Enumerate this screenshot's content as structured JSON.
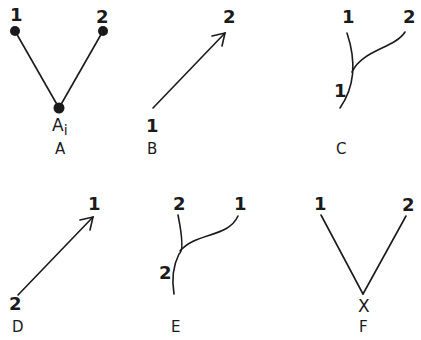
{
  "panels": {
    "A": {
      "caption": "A",
      "nodes": {
        "left_label": "1",
        "right_label": "2",
        "bottom_label": "A",
        "bottom_subscript": "i"
      },
      "description": "Two filled nodes 1 and 2 joined by lines to a filled node Ai below"
    },
    "B": {
      "caption": "B",
      "start_label": "1",
      "end_label": "2",
      "description": "Arrow from 1 (bottom-left) to 2 (top-right)"
    },
    "C": {
      "caption": "C",
      "top_left_label": "1",
      "top_right_label": "2",
      "lower_label": "1",
      "description": "Curve 1 continues downward; branch 2 merges into it"
    },
    "D": {
      "caption": "D",
      "start_label": "2",
      "end_label": "1",
      "description": "Arrow from 2 (bottom-left) to 1 (top-right)"
    },
    "E": {
      "caption": "E",
      "top_left_label": "2",
      "top_right_label": "1",
      "lower_label": "2",
      "description": "Curve 2 continues downward; branch 1 merges into it"
    },
    "F": {
      "caption": "F",
      "left_label": "1",
      "right_label": "2",
      "bottom_label": "X",
      "description": "Lines from 1 and 2 meeting at X"
    }
  }
}
